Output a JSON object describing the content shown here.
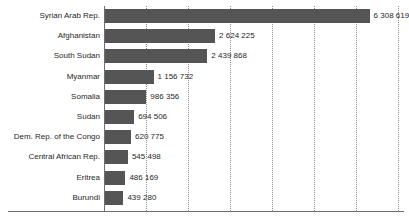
{
  "chart_data": {
    "type": "bar",
    "orientation": "horizontal",
    "title": "",
    "subtitle": "",
    "xlabel": "",
    "ylabel": "",
    "xlim": [
      0,
      7200000
    ],
    "grid": "vertical-dotted",
    "legend": "none",
    "tick_labels": [],
    "gridline_values": [
      1000000,
      2000000,
      3000000,
      4000000,
      5000000,
      6000000,
      7000000
    ],
    "categories": [
      "Syrian Arab Rep.",
      "Afghanistan",
      "South Sudan",
      "Myanmar",
      "Somalia",
      "Sudan",
      "Dem. Rep. of the Congo",
      "Central African Rep.",
      "Eritrea",
      "Burundi"
    ],
    "values": [
      6308619,
      2624225,
      2439868,
      1156732,
      986356,
      694506,
      620775,
      545498,
      486169,
      439280
    ],
    "value_labels": [
      "6 308 619",
      "2 624 225",
      "2 439 868",
      "1 156 732",
      "986 356",
      "694 506",
      "620 775",
      "545 498",
      "486 169",
      "439 280"
    ],
    "colors": {
      "bar": "#555555",
      "gridline": "#8d8d8d",
      "axis": "#6f6f6f",
      "text": "#1f1f1f",
      "background": "#ffffff"
    }
  }
}
